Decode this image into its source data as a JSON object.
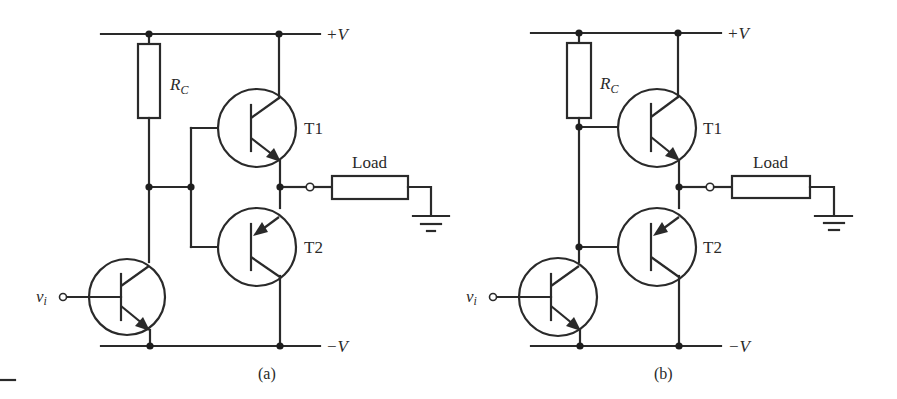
{
  "figure": {
    "panels": [
      {
        "id": "a",
        "caption": "(a)",
        "supply_positive": "+V",
        "supply_negative": "−V",
        "resistor_label": "R",
        "resistor_subscript": "C",
        "transistor_top": "T1",
        "transistor_bottom": "T2",
        "load_label": "Load",
        "input_label": "v",
        "input_subscript": "i",
        "topology": "T1/T2 bases joined together and connected to RC/driver collector node"
      },
      {
        "id": "b",
        "caption": "(b)",
        "supply_positive": "+V",
        "supply_negative": "−V",
        "resistor_label": "R",
        "resistor_subscript": "C",
        "transistor_top": "T1",
        "transistor_bottom": "T2",
        "load_label": "Load",
        "input_label": "v",
        "input_subscript": "i",
        "topology": "T1 base at RC bottom, T2 base at driver collector"
      }
    ],
    "colors": {
      "ink": "#2a2a2a",
      "background": "#ffffff"
    }
  }
}
